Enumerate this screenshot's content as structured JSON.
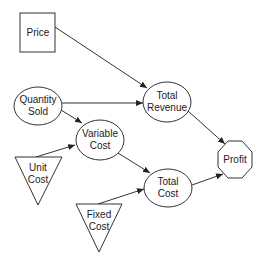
{
  "diagram": {
    "colors": {
      "stroke": "#333333",
      "fill": "#ffffff",
      "text": "#222222"
    },
    "nodes": {
      "price": {
        "label1": "Price",
        "label2": "",
        "shape": "square"
      },
      "quantity_sold": {
        "label1": "Quantity",
        "label2": "Sold",
        "shape": "ellipse"
      },
      "total_revenue": {
        "label1": "Total",
        "label2": "Revenue",
        "shape": "ellipse"
      },
      "variable_cost": {
        "label1": "Variable",
        "label2": "Cost",
        "shape": "ellipse"
      },
      "unit_cost": {
        "label1": "Unit",
        "label2": "Cost",
        "shape": "triangle"
      },
      "total_cost": {
        "label1": "Total",
        "label2": "Cost",
        "shape": "ellipse"
      },
      "fixed_cost": {
        "label1": "Fixed",
        "label2": "Cost",
        "shape": "triangle"
      },
      "profit": {
        "label1": "Profit",
        "label2": "",
        "shape": "octagon"
      }
    },
    "edges": [
      {
        "from": "Price",
        "to": "Total Revenue"
      },
      {
        "from": "Quantity Sold",
        "to": "Total Revenue"
      },
      {
        "from": "Quantity Sold",
        "to": "Variable Cost"
      },
      {
        "from": "Unit Cost",
        "to": "Variable Cost"
      },
      {
        "from": "Variable Cost",
        "to": "Total Cost"
      },
      {
        "from": "Fixed Cost",
        "to": "Total Cost"
      },
      {
        "from": "Total Revenue",
        "to": "Profit"
      },
      {
        "from": "Total Cost",
        "to": "Profit"
      }
    ]
  }
}
